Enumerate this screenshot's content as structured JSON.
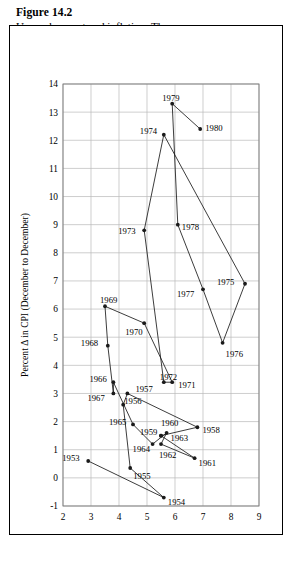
{
  "figure": {
    "label": "Figure 14.2",
    "title_line1": "Unemployment and inflation: The",
    "title_line2": "chronological pattern"
  },
  "chart_data": {
    "type": "scatter",
    "title": "Unemployment and inflation: The chronological pattern",
    "xlabel": "Average annual rate of unemployment",
    "ylabel": "Percent Δ in CPI (December to December)",
    "xlim": [
      2,
      9
    ],
    "ylim": [
      -1,
      14
    ],
    "xticks": [
      2,
      3,
      4,
      5,
      6,
      7,
      8,
      9
    ],
    "yticks": [
      -1,
      0,
      1,
      2,
      3,
      4,
      5,
      6,
      7,
      8,
      9,
      10,
      11,
      12,
      13,
      14
    ],
    "grid": true,
    "legend": "none",
    "connected": true,
    "point_label_key": "year",
    "points": [
      {
        "year": "1953",
        "x": 2.9,
        "y": 0.6,
        "lx": -26,
        "ly": -3
      },
      {
        "year": "1954",
        "x": 5.6,
        "y": -0.7,
        "lx": 4,
        "ly": 4
      },
      {
        "year": "1955",
        "x": 4.4,
        "y": 0.35,
        "lx": 3,
        "ly": 8
      },
      {
        "year": "1956",
        "x": 4.15,
        "y": 2.6,
        "lx": 1,
        "ly": -4
      },
      {
        "year": "1957",
        "x": 4.3,
        "y": 3.0,
        "lx": 8,
        "ly": -4
      },
      {
        "year": "1958",
        "x": 6.8,
        "y": 1.8,
        "lx": 5,
        "ly": 3
      },
      {
        "year": "1959",
        "x": 5.5,
        "y": 1.5,
        "lx": -21,
        "ly": -4
      },
      {
        "year": "1960",
        "x": 5.5,
        "y": 1.5,
        "lx": 0,
        "ly": -13
      },
      {
        "year": "1961",
        "x": 6.7,
        "y": 0.7,
        "lx": 4,
        "ly": 5
      },
      {
        "year": "1962",
        "x": 5.5,
        "y": 1.2,
        "lx": -2,
        "ly": 11
      },
      {
        "year": "1963",
        "x": 5.7,
        "y": 1.6,
        "lx": 4,
        "ly": 5
      },
      {
        "year": "1964",
        "x": 5.2,
        "y": 1.2,
        "lx": -20,
        "ly": 5
      },
      {
        "year": "1965",
        "x": 4.5,
        "y": 1.9,
        "lx": -24,
        "ly": -2
      },
      {
        "year": "1966",
        "x": 3.8,
        "y": 3.4,
        "lx": -24,
        "ly": -3
      },
      {
        "year": "1967",
        "x": 3.8,
        "y": 3.0,
        "lx": -26,
        "ly": 5
      },
      {
        "year": "1968",
        "x": 3.6,
        "y": 4.7,
        "lx": -27,
        "ly": -3
      },
      {
        "year": "1969",
        "x": 3.5,
        "y": 6.1,
        "lx": -5,
        "ly": -6
      },
      {
        "year": "1970",
        "x": 4.9,
        "y": 5.5,
        "lx": -19,
        "ly": 9
      },
      {
        "year": "1971",
        "x": 5.9,
        "y": 3.4,
        "lx": 6,
        "ly": 3
      },
      {
        "year": "1972",
        "x": 5.6,
        "y": 3.4,
        "lx": -4,
        "ly": -5
      },
      {
        "year": "1973",
        "x": 4.9,
        "y": 8.8,
        "lx": -26,
        "ly": 1
      },
      {
        "year": "1974",
        "x": 5.6,
        "y": 12.2,
        "lx": -24,
        "ly": -4
      },
      {
        "year": "1975",
        "x": 8.5,
        "y": 6.9,
        "lx": -28,
        "ly": -2
      },
      {
        "year": "1976",
        "x": 7.7,
        "y": 4.8,
        "lx": 3,
        "ly": 11
      },
      {
        "year": "1977",
        "x": 7.0,
        "y": 6.7,
        "lx": -26,
        "ly": 5
      },
      {
        "year": "1978",
        "x": 6.1,
        "y": 9.0,
        "lx": 4,
        "ly": 2
      },
      {
        "year": "1979",
        "x": 5.9,
        "y": 13.3,
        "lx": -10,
        "ly": -6
      },
      {
        "year": "1980",
        "x": 6.9,
        "y": 12.4,
        "lx": 5,
        "ly": -1
      }
    ]
  },
  "colors": {
    "line": "#1a1a1a",
    "grid": "#b9b9b9",
    "frame": "#7a7a7a",
    "border": "#000000",
    "background": "#ffffff"
  }
}
